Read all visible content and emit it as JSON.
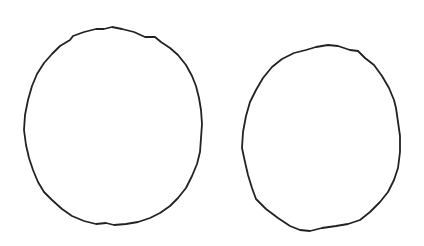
{
  "image": {
    "description": "Two hand-drawn irregular ovals outlined in black on white background",
    "background": "#ffffff",
    "stroke_color": "#222222",
    "shapes": [
      {
        "name": "left-oval",
        "cx": 113,
        "cy": 126,
        "rx": 89,
        "ry": 99
      },
      {
        "name": "right-oval",
        "cx": 321,
        "cy": 139,
        "rx": 80,
        "ry": 93
      }
    ]
  }
}
